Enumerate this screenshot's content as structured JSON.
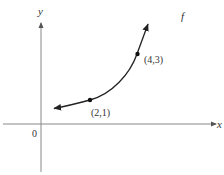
{
  "figure": {
    "function_label": "f",
    "axes": {
      "x_label": "x",
      "y_label": "y",
      "origin_label": "0"
    },
    "points": [
      {
        "label": "(2,1)",
        "x": 2,
        "y": 1
      },
      {
        "label": "(4,3)",
        "x": 4,
        "y": 3
      }
    ],
    "colors": {
      "axis": "#888888",
      "curve": "#222222",
      "text": "#333333"
    }
  }
}
